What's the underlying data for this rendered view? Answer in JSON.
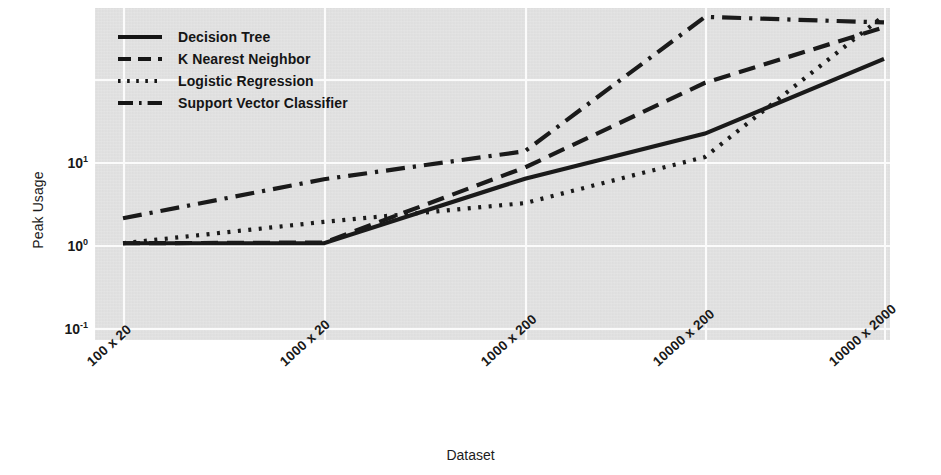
{
  "chart_data": {
    "type": "line",
    "title": "",
    "xlabel": "Dataset",
    "ylabel": "Peak Usage",
    "yscale": "log",
    "ylim": [
      0.08,
      80
    ],
    "grid": true,
    "legend_position": "top-left",
    "categories": [
      "100 x 20",
      "1000 x 20",
      "1000 x 200",
      "10000 x 200",
      "10000 x 2000"
    ],
    "ytick_labels": [
      "10¹",
      "10⁰",
      "10⁻¹"
    ],
    "yticks": [
      10,
      1,
      0.1
    ],
    "series": [
      {
        "name": "Decision Tree",
        "style": "solid",
        "values": [
          0.105,
          0.105,
          0.63,
          2.2,
          17.5
        ]
      },
      {
        "name": "K Nearest Neighbor",
        "style": "dashed",
        "values": [
          0.105,
          0.107,
          0.86,
          9.0,
          42.0
        ]
      },
      {
        "name": "Logistic Regression",
        "style": "dotted",
        "values": [
          0.105,
          0.19,
          0.32,
          1.15,
          58.0
        ]
      },
      {
        "name": "Support Vector Classifier",
        "style": "dashdot",
        "values": [
          0.21,
          0.62,
          1.35,
          56.0,
          48.0
        ]
      }
    ]
  },
  "legend": {
    "items": [
      {
        "label": "Decision Tree",
        "style": "solid"
      },
      {
        "label": "K Nearest Neighbor",
        "style": "dashed"
      },
      {
        "label": "Logistic Regression",
        "style": "dotted"
      },
      {
        "label": "Support Vector Classifier",
        "style": "dashdot"
      }
    ]
  },
  "colors": {
    "line": "#1a1a1a",
    "panel_background": "#e2e2e2",
    "gridline": "#fbfbfb",
    "page_background": "#ffffff"
  }
}
